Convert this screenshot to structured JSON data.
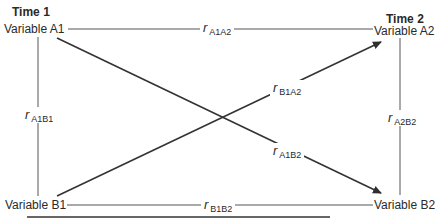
{
  "diagram": {
    "type": "cross-lagged panel design",
    "time_labels": {
      "time1": "Time 1",
      "time2": "Time 2"
    },
    "nodes": {
      "A1": "Variable A1",
      "A2": "Variable A2",
      "B1": "Variable B1",
      "B2": "Variable B2"
    },
    "edges": [
      {
        "from": "A1",
        "to": "A2",
        "r": "r",
        "sub": "A1A2",
        "directed": false
      },
      {
        "from": "B1",
        "to": "B2",
        "r": "r",
        "sub": "B1B2",
        "directed": false
      },
      {
        "from": "A1",
        "to": "B1",
        "r": "r",
        "sub": "A1B1",
        "directed": false
      },
      {
        "from": "A2",
        "to": "B2",
        "r": "r",
        "sub": "A2B2",
        "directed": false
      },
      {
        "from": "B1",
        "to": "A2",
        "r": "r",
        "sub": "B1A2",
        "directed": true
      },
      {
        "from": "A1",
        "to": "B2",
        "r": "r",
        "sub": "A1B2",
        "directed": true
      }
    ],
    "line_color": "#3a3a3a"
  }
}
